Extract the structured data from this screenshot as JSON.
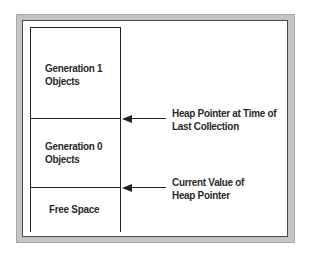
{
  "diagram": {
    "type": "managed-heap-generations",
    "segments": [
      {
        "label_line1": "Generation 1",
        "label_line2": "Objects"
      },
      {
        "label_line1": "Generation 0",
        "label_line2": "Objects"
      },
      {
        "label_line1": "Free Space"
      }
    ],
    "pointers": [
      {
        "label_line1": "Heap Pointer at Time of",
        "label_line2": "Last Collection"
      },
      {
        "label_line1": "Current Value of",
        "label_line2": "Heap Pointer"
      }
    ],
    "colors": {
      "frame_gray": "#c4c4c4",
      "line": "#222222",
      "text": "#2a2a2a",
      "background": "#ffffff"
    }
  }
}
